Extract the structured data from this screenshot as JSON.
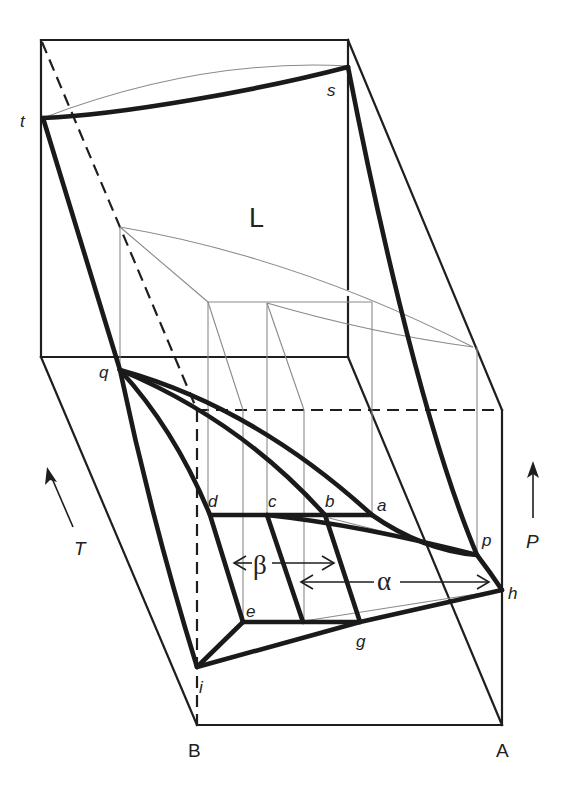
{
  "figure": {
    "region_labels": {
      "liquid": "L"
    },
    "point_labels": {
      "t": "t",
      "s": "s",
      "q": "q",
      "a": "a",
      "b": "b",
      "c": "c",
      "d": "d",
      "e": "e",
      "g": "g",
      "h": "h",
      "i": "i",
      "p": "p"
    },
    "phase_labels": {
      "alpha": "α",
      "beta": "β"
    },
    "axis_labels": {
      "temperature": "T",
      "pressure": "P"
    },
    "component_labels": {
      "A": "A",
      "B": "B"
    },
    "colors": {
      "line": "#1a1a1a",
      "thin_line": "#8a8a8a",
      "background": "#ffffff"
    }
  }
}
